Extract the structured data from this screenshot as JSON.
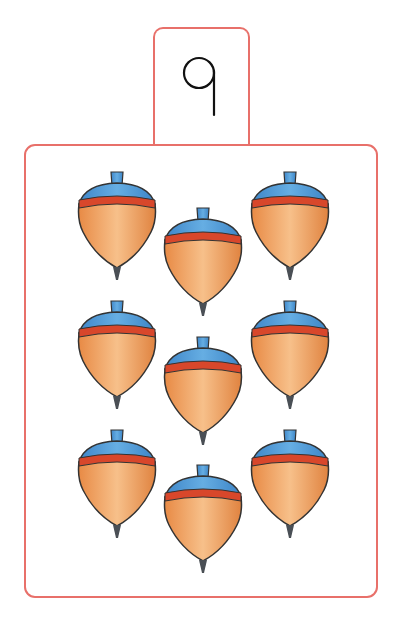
{
  "header": {
    "title_cut": "azabmoo"
  },
  "card": {
    "numeral": "9",
    "count": 9,
    "object_icon": "spinning-top-icon",
    "colors": {
      "border": "#e8706a",
      "top_cap": "#4f98d6",
      "band": "#d8472b",
      "body": "#f0a868",
      "tip": "#4a4f55"
    },
    "items": [
      {
        "x": 117,
        "y": 170
      },
      {
        "x": 203,
        "y": 206
      },
      {
        "x": 290,
        "y": 170
      },
      {
        "x": 117,
        "y": 299
      },
      {
        "x": 203,
        "y": 335
      },
      {
        "x": 290,
        "y": 299
      },
      {
        "x": 117,
        "y": 428
      },
      {
        "x": 203,
        "y": 463
      },
      {
        "x": 290,
        "y": 428
      }
    ]
  }
}
